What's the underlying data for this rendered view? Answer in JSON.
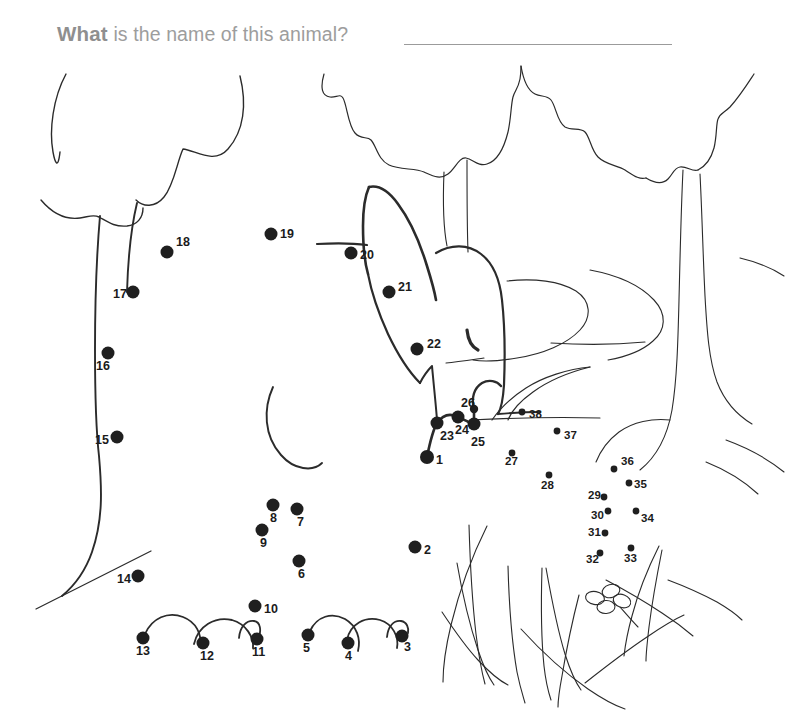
{
  "page": {
    "title_lead": "What",
    "title_rest": " is the name of this animal?",
    "answer_line_name": "answer-blank-line",
    "background_color": "#ffffff",
    "ink_color": "#262626",
    "title_color": "#9d9d9d"
  },
  "worksheet": {
    "kind": "connect-the-dots",
    "total_dots": 38,
    "hidden_picture": "deer",
    "dot_numbers": [
      "1",
      "2",
      "3",
      "4",
      "5",
      "6",
      "7",
      "8",
      "9",
      "10",
      "11",
      "12",
      "13",
      "14",
      "15",
      "16",
      "17",
      "18",
      "19",
      "20",
      "21",
      "22",
      "23",
      "24",
      "25",
      "26",
      "27",
      "28",
      "29",
      "30",
      "31",
      "32",
      "33",
      "34",
      "35",
      "36",
      "37",
      "38"
    ]
  },
  "dots": [
    {
      "n": "1",
      "x": 427,
      "y": 457,
      "r": 7.0,
      "lx": 436,
      "ly": 461,
      "size": "lg"
    },
    {
      "n": "2",
      "x": 415,
      "y": 547,
      "r": 6.5,
      "lx": 424,
      "ly": 551,
      "size": "lg"
    },
    {
      "n": "3",
      "x": 402,
      "y": 636,
      "r": 6.5,
      "lx": 404,
      "ly": 648,
      "size": "lg"
    },
    {
      "n": "4",
      "x": 348,
      "y": 643,
      "r": 6.5,
      "lx": 345,
      "ly": 657,
      "size": "lg"
    },
    {
      "n": "5",
      "x": 308,
      "y": 635,
      "r": 6.5,
      "lx": 303,
      "ly": 649,
      "size": "lg"
    },
    {
      "n": "6",
      "x": 299,
      "y": 561,
      "r": 6.5,
      "lx": 298,
      "ly": 575,
      "size": "lg"
    },
    {
      "n": "7",
      "x": 297,
      "y": 509,
      "r": 6.5,
      "lx": 297,
      "ly": 523,
      "size": "lg"
    },
    {
      "n": "8",
      "x": 273,
      "y": 505,
      "r": 6.5,
      "lx": 270,
      "ly": 519,
      "size": "lg"
    },
    {
      "n": "9",
      "x": 262,
      "y": 530,
      "r": 6.5,
      "lx": 260,
      "ly": 544,
      "size": "lg"
    },
    {
      "n": "10",
      "x": 255,
      "y": 606,
      "r": 6.5,
      "lx": 264,
      "ly": 610,
      "size": "lg"
    },
    {
      "n": "11",
      "x": 257,
      "y": 639,
      "r": 6.5,
      "lx": 252,
      "ly": 653,
      "size": "lg"
    },
    {
      "n": "12",
      "x": 203,
      "y": 643,
      "r": 6.5,
      "lx": 200,
      "ly": 657,
      "size": "lg"
    },
    {
      "n": "13",
      "x": 143,
      "y": 638,
      "r": 6.5,
      "lx": 136,
      "ly": 652,
      "size": "lg"
    },
    {
      "n": "14",
      "x": 138,
      "y": 576,
      "r": 6.5,
      "lx": 117,
      "ly": 580,
      "size": "lg"
    },
    {
      "n": "15",
      "x": 117,
      "y": 437,
      "r": 6.5,
      "lx": 95,
      "ly": 441,
      "size": "lg"
    },
    {
      "n": "16",
      "x": 108,
      "y": 353,
      "r": 6.5,
      "lx": 96,
      "ly": 367,
      "size": "lg"
    },
    {
      "n": "17",
      "x": 133,
      "y": 292,
      "r": 6.5,
      "lx": 113,
      "ly": 295,
      "size": "lg"
    },
    {
      "n": "18",
      "x": 167,
      "y": 252,
      "r": 6.5,
      "lx": 176,
      "ly": 243,
      "size": "lg"
    },
    {
      "n": "19",
      "x": 271,
      "y": 234,
      "r": 6.5,
      "lx": 280,
      "ly": 235,
      "size": "lg"
    },
    {
      "n": "20",
      "x": 351,
      "y": 253,
      "r": 6.5,
      "lx": 360,
      "ly": 256,
      "size": "lg"
    },
    {
      "n": "21",
      "x": 389,
      "y": 292,
      "r": 6.5,
      "lx": 398,
      "ly": 288,
      "size": "lg"
    },
    {
      "n": "22",
      "x": 417,
      "y": 349,
      "r": 6.5,
      "lx": 427,
      "ly": 345,
      "size": "lg"
    },
    {
      "n": "23",
      "x": 437,
      "y": 423,
      "r": 6.5,
      "lx": 440,
      "ly": 437,
      "size": "lg"
    },
    {
      "n": "24",
      "x": 458,
      "y": 417,
      "r": 6.5,
      "lx": 455,
      "ly": 431,
      "size": "lg"
    },
    {
      "n": "25",
      "x": 474,
      "y": 424,
      "r": 6.5,
      "lx": 471,
      "ly": 443,
      "size": "lg"
    },
    {
      "n": "26",
      "x": 474,
      "y": 409,
      "r": 4.2,
      "lx": 461,
      "ly": 404,
      "size": "lg"
    },
    {
      "n": "27",
      "x": 512,
      "y": 453,
      "r": 3.4,
      "lx": 505,
      "ly": 463,
      "size": "sm"
    },
    {
      "n": "28",
      "x": 549,
      "y": 475,
      "r": 3.4,
      "lx": 541,
      "ly": 487,
      "size": "sm"
    },
    {
      "n": "29",
      "x": 604,
      "y": 497,
      "r": 3.4,
      "lx": 588,
      "ly": 497,
      "size": "sm"
    },
    {
      "n": "30",
      "x": 608,
      "y": 511,
      "r": 3.4,
      "lx": 591,
      "ly": 517,
      "size": "sm"
    },
    {
      "n": "31",
      "x": 605,
      "y": 533,
      "r": 3.4,
      "lx": 588,
      "ly": 534,
      "size": "sm"
    },
    {
      "n": "32",
      "x": 600,
      "y": 553,
      "r": 3.4,
      "lx": 586,
      "ly": 561,
      "size": "sm"
    },
    {
      "n": "33",
      "x": 631,
      "y": 548,
      "r": 3.4,
      "lx": 624,
      "ly": 560,
      "size": "sm"
    },
    {
      "n": "34",
      "x": 636,
      "y": 511,
      "r": 3.4,
      "lx": 641,
      "ly": 520,
      "size": "sm"
    },
    {
      "n": "35",
      "x": 629,
      "y": 483,
      "r": 3.4,
      "lx": 634,
      "ly": 486,
      "size": "sm"
    },
    {
      "n": "36",
      "x": 614,
      "y": 469,
      "r": 3.4,
      "lx": 621,
      "ly": 463,
      "size": "sm"
    },
    {
      "n": "37",
      "x": 557,
      "y": 431,
      "r": 3.4,
      "lx": 564,
      "ly": 437,
      "size": "sm"
    },
    {
      "n": "38",
      "x": 522,
      "y": 412,
      "r": 3.4,
      "lx": 529,
      "ly": 416,
      "size": "sm"
    }
  ],
  "scene": {
    "trees": [
      {
        "name": "tree-left",
        "description": "leafy tree with tall curved trunk"
      },
      {
        "name": "tree-center",
        "description": "scalloped canopy tree with thin trunk"
      },
      {
        "name": "tree-right",
        "description": "tree with thick trunk and roots"
      }
    ],
    "animal": {
      "name": "deer-head",
      "description": "partially drawn deer head with two ears and eye"
    },
    "grass": {
      "name": "grass-tuft",
      "description": "tufts of tall grass blades"
    },
    "flower": {
      "name": "flower",
      "description": "small four-petal flower"
    },
    "hills": {
      "name": "background-hills",
      "description": "rolling background landscape curves"
    },
    "ground": {
      "name": "ground-line",
      "description": "diagonal ground line at lower left"
    }
  }
}
